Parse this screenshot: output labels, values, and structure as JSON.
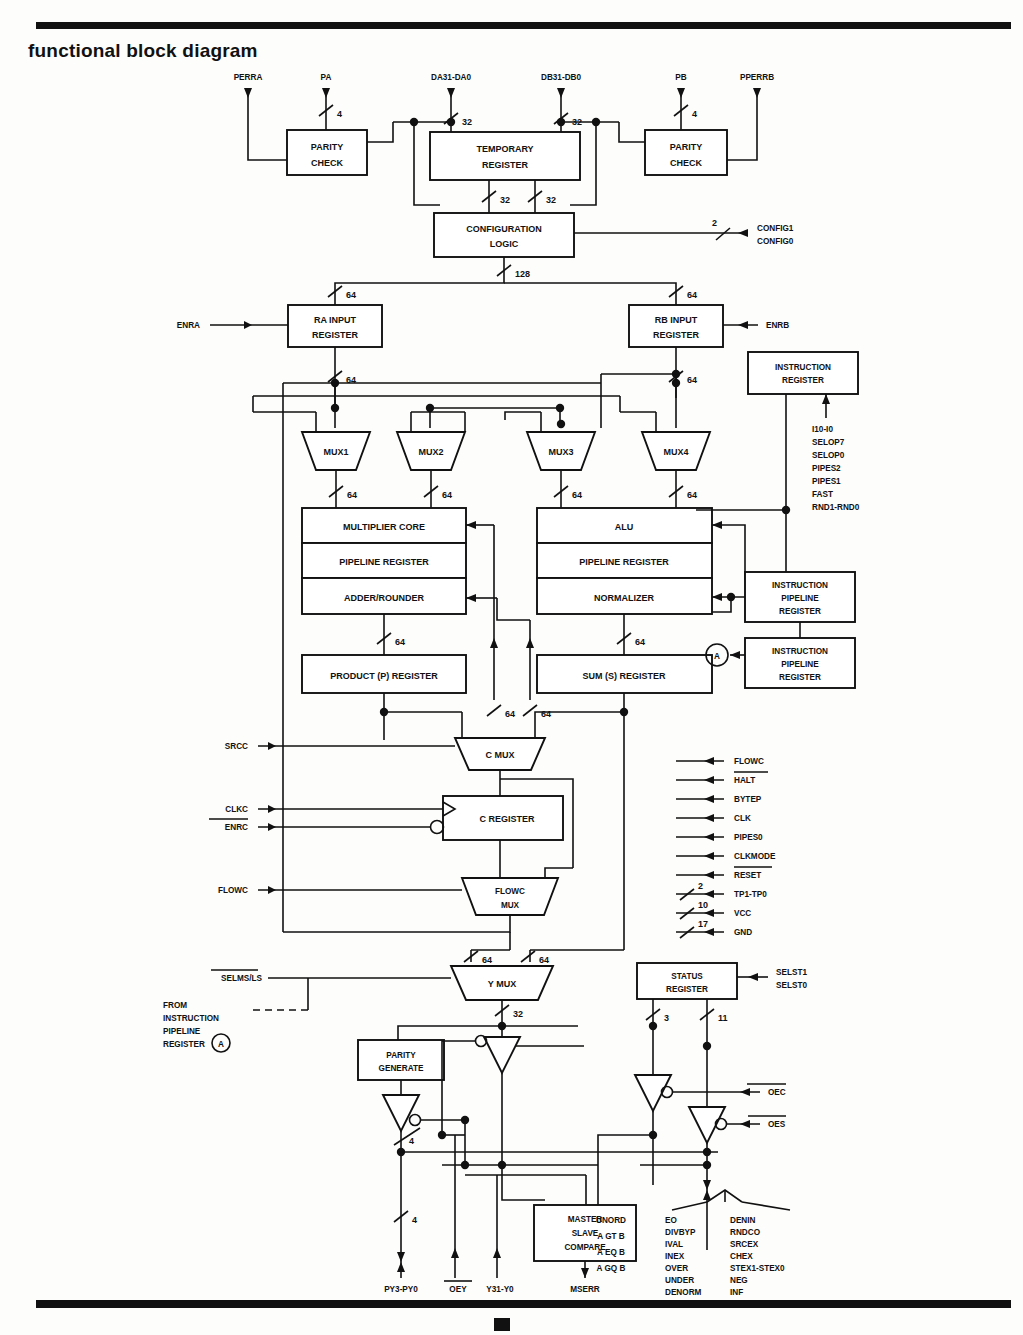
{
  "page": {
    "title": "functional block diagram"
  },
  "top_signals": {
    "perra": "PERRA",
    "pa": "PA",
    "da": "DA31-DA0",
    "db": "DB31-DB0",
    "pb": "PB",
    "pperrb": "PPERRB"
  },
  "blocks": {
    "parity_check_a": "PARITY\nCHECK",
    "parity_check_a_l1": "PARITY",
    "parity_check_a_l2": "CHECK",
    "temporary_register_l1": "TEMPORARY",
    "temporary_register_l2": "REGISTER",
    "parity_check_b_l1": "PARITY",
    "parity_check_b_l2": "CHECK",
    "configuration_logic_l1": "CONFIGURATION",
    "configuration_logic_l2": "LOGIC",
    "ra_input_register_l1": "RA INPUT",
    "ra_input_register_l2": "REGISTER",
    "rb_input_register_l1": "RB INPUT",
    "rb_input_register_l2": "REGISTER",
    "instruction_register_l1": "INSTRUCTION",
    "instruction_register_l2": "REGISTER",
    "mux1": "MUX1",
    "mux2": "MUX2",
    "mux3": "MUX3",
    "mux4": "MUX4",
    "multiplier_core": "MULTIPLIER CORE",
    "pipeline_register_m": "PIPELINE REGISTER",
    "adder_rounder": "ADDER/ROUNDER",
    "alu": "ALU",
    "pipeline_register_a": "PIPELINE REGISTER",
    "normalizer": "NORMALIZER",
    "product_register": "PRODUCT (P) REGISTER",
    "sum_register": "SUM (S) REGISTER",
    "instruction_pipeline_register_1_l1": "INSTRUCTION",
    "instruction_pipeline_register_1_l2": "PIPELINE",
    "instruction_pipeline_register_1_l3": "REGISTER",
    "instruction_pipeline_register_2_l1": "INSTRUCTION",
    "instruction_pipeline_register_2_l2": "PIPELINE",
    "instruction_pipeline_register_2_l3": "REGISTER",
    "c_mux": "C MUX",
    "c_register": "C REGISTER",
    "flowc_mux_l1": "FLOWC",
    "flowc_mux_l2": "MUX",
    "y_mux": "Y MUX",
    "status_register_l1": "STATUS",
    "status_register_l2": "REGISTER",
    "parity_generate_l1": "PARITY",
    "parity_generate_l2": "GENERATE",
    "master_slave_compare_l1": "MASTER",
    "master_slave_compare_l2": "SLAVE",
    "master_slave_compare_l3": "COMPARE",
    "node_a": "A"
  },
  "bus_widths": {
    "pa": "4",
    "da": "32",
    "db": "32",
    "pb": "4",
    "temp_out_left": "32",
    "temp_out_right": "32",
    "config_out": "128",
    "config_sel": "2",
    "ra_in": "64",
    "ra_out": "64",
    "rb_in": "64",
    "rb_out": "64",
    "mux1_out": "64",
    "mux2_out": "64",
    "mux3_out": "64",
    "mux4_out": "64",
    "p_in": "64",
    "s_in": "64",
    "p_out": "64",
    "mid_left": "64",
    "mid_right": "64",
    "ymux_in_left": "64",
    "ymux_in_right": "64",
    "ymux_out": "32",
    "status_left": "3",
    "status_right": "11",
    "parity_out": "4",
    "py_out": "4",
    "tp": "2",
    "vcc": "10",
    "gnd": "17"
  },
  "left_signals": {
    "enra": "ENRA",
    "srcc": "SRCC",
    "clkc": "CLKC",
    "enrc": "ENRC",
    "enrc_bar": true,
    "flowc": "FLOWC",
    "selms_ls": "SELMS/LS",
    "from_note_l1": "FROM",
    "from_note_l2": "INSTRUCTION",
    "from_note_l3": "PIPELINE",
    "from_note_l4": "REGISTER",
    "from_note_tag": "A"
  },
  "right_signals": {
    "config1": "CONFIG1",
    "config0": "CONFIG0",
    "enrb": "ENRB",
    "selst1": "SELST1",
    "selst0": "SELST0",
    "oec": "OEC",
    "oes": "OES"
  },
  "instruction_inputs": [
    "I10-I0",
    "SELOP7",
    "SELOP0",
    "PIPES2",
    "PIPES1",
    "FAST",
    "RND1-RND0"
  ],
  "control_signals": [
    {
      "label": "FLOWC",
      "width": "",
      "overbar": false
    },
    {
      "label": "HALT",
      "width": "",
      "overbar": true
    },
    {
      "label": "BYTEP",
      "width": "",
      "overbar": false
    },
    {
      "label": "CLK",
      "width": "",
      "overbar": false
    },
    {
      "label": "PIPES0",
      "width": "",
      "overbar": false
    },
    {
      "label": "CLKMODE",
      "width": "",
      "overbar": false
    },
    {
      "label": "RESET",
      "width": "",
      "overbar": true
    },
    {
      "label": "TP1-TP0",
      "width": "2",
      "overbar": false
    },
    {
      "label": "VCC",
      "width": "10",
      "overbar": false
    },
    {
      "label": "GND",
      "width": "17",
      "overbar": false
    }
  ],
  "bottom_outputs": {
    "py": "PY3-PY0",
    "oey": "OEY",
    "y": "Y31-Y0",
    "mserr": "MSERR"
  },
  "status_flags_col0": [
    "UNORD",
    "A GT B",
    "A EQ B",
    "A GQ B"
  ],
  "status_flags_col1": [
    "EO",
    "DIVBYP",
    "IVAL",
    "INEX",
    "OVER",
    "UNDER",
    "DENORM"
  ],
  "status_flags_col2": [
    "DENIN",
    "RNDCO",
    "SRCEX",
    "CHEX",
    "STEX1-STEX0",
    "NEG",
    "INF"
  ],
  "colors": {
    "ink": "#111111",
    "paper": "#fdfdfc"
  }
}
